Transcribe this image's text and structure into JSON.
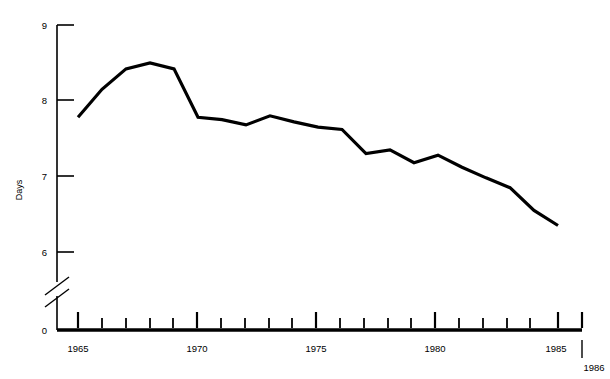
{
  "chart_data": {
    "type": "line",
    "title": "",
    "subtitle": "",
    "xlabel": "",
    "ylabel": "Days",
    "grid": false,
    "legend": "none",
    "line_color": "#000000",
    "background_color": "#ffffff",
    "axis_break": true,
    "axis_break_note": "y-axis broken between 0 and 6",
    "xlim": [
      1964,
      1986
    ],
    "ylim": [
      6,
      9
    ],
    "y_baseline_label": "0",
    "y_ticks": [
      6,
      7,
      8,
      9
    ],
    "y_tick_labels": [
      "6",
      "7",
      "8",
      "9"
    ],
    "x_ticks": [
      1964,
      1965,
      1966,
      1967,
      1968,
      1969,
      1970,
      1971,
      1972,
      1973,
      1974,
      1975,
      1976,
      1977,
      1978,
      1979,
      1980,
      1981,
      1982,
      1983,
      1984,
      1985,
      1986
    ],
    "x_major_ticks": [
      1965,
      1970,
      1975,
      1980,
      1985
    ],
    "x_tick_labels": [
      "1965",
      "1970",
      "1975",
      "1980",
      "1985"
    ],
    "x_end_label": "1986",
    "x": [
      1965,
      1966,
      1967,
      1968,
      1969,
      1970,
      1971,
      1972,
      1973,
      1974,
      1975,
      1976,
      1977,
      1978,
      1979,
      1980,
      1981,
      1982,
      1983,
      1984,
      1985
    ],
    "values": [
      7.78,
      8.15,
      8.42,
      8.5,
      8.42,
      7.78,
      7.75,
      7.68,
      7.8,
      7.72,
      7.65,
      7.62,
      7.3,
      7.35,
      7.18,
      7.28,
      7.12,
      6.98,
      6.85,
      6.55,
      6.35
    ],
    "series": [
      {
        "name": "Days",
        "values": [
          7.78,
          8.15,
          8.42,
          8.5,
          8.42,
          7.78,
          7.75,
          7.68,
          7.8,
          7.72,
          7.65,
          7.62,
          7.3,
          7.35,
          7.18,
          7.28,
          7.12,
          6.98,
          6.85,
          6.55,
          6.35
        ]
      }
    ]
  }
}
